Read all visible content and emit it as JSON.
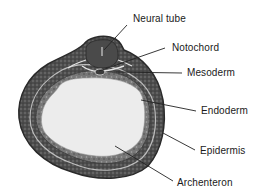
{
  "figure": {
    "type": "embryo-cross-section",
    "labels": [
      {
        "id": "neural-tube",
        "text": "Neural tube",
        "x": 133,
        "y": 13,
        "line": [
          127,
          25,
          104,
          50
        ]
      },
      {
        "id": "notochord",
        "text": "Notochord",
        "x": 172,
        "y": 42,
        "line": [
          165,
          48,
          99,
          71
        ]
      },
      {
        "id": "mesoderm",
        "text": "Mesoderm",
        "x": 187,
        "y": 67,
        "line": [
          182,
          73,
          116,
          72
        ]
      },
      {
        "id": "endoderm",
        "text": "Endoderm",
        "x": 201,
        "y": 105,
        "line": [
          196,
          111,
          141,
          100
        ]
      },
      {
        "id": "epidermis",
        "text": "Epidermis",
        "x": 200,
        "y": 145,
        "line": [
          195,
          150,
          163,
          133
        ]
      },
      {
        "id": "archenteron",
        "text": "Archenteron",
        "x": 177,
        "y": 177,
        "line": [
          173,
          181,
          115,
          146
        ]
      }
    ],
    "colors": {
      "outer_layer": "#3a3a3a",
      "mid_layer": "#6a6a6a",
      "inner_cavity": "#ececec",
      "neural_tube": "#4a4a4a",
      "label_text": "#1a1a1a",
      "leader_line": "#222222"
    }
  }
}
